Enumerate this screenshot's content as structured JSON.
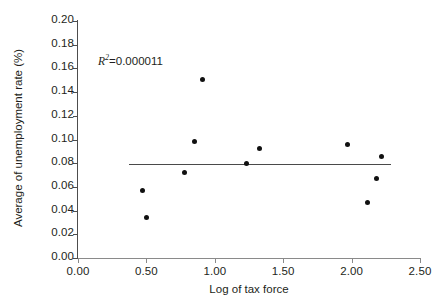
{
  "chart_data": {
    "type": "scatter",
    "title": "",
    "xlabel": "Log of tax force",
    "ylabel": "Average of unemployment rate (%)",
    "xlim": [
      0.0,
      2.5
    ],
    "ylim": [
      0.0,
      0.2
    ],
    "xticks": [
      "0.00",
      "0.50",
      "1.00",
      "1.50",
      "2.00",
      "2.50"
    ],
    "xtick_values": [
      0.0,
      0.5,
      1.0,
      1.5,
      2.0,
      2.5
    ],
    "yticks": [
      "0.00",
      "0.02",
      "0.04",
      "0.06",
      "0.08",
      "0.10",
      "0.12",
      "0.14",
      "0.16",
      "0.18",
      "0.20"
    ],
    "ytick_values": [
      0.0,
      0.02,
      0.04,
      0.06,
      0.08,
      0.1,
      0.12,
      0.14,
      0.16,
      0.18,
      0.2
    ],
    "grid": false,
    "legend": false,
    "annotations": [
      {
        "name": "r-squared",
        "prefix": "R",
        "superscript": "2",
        "text": "=0.000011",
        "value": 1.1e-05,
        "x": 0.37,
        "y": 0.168
      }
    ],
    "marker": {
      "shape": "circle",
      "color": "#111111",
      "size": 5
    },
    "points": [
      {
        "x": 0.47,
        "y": 0.057
      },
      {
        "x": 0.502,
        "y": 0.0338
      },
      {
        "x": 0.78,
        "y": 0.072
      },
      {
        "x": 0.855,
        "y": 0.0982
      },
      {
        "x": 0.91,
        "y": 0.151
      },
      {
        "x": 1.235,
        "y": 0.08
      },
      {
        "x": 1.325,
        "y": 0.0925
      },
      {
        "x": 1.97,
        "y": 0.0955
      },
      {
        "x": 2.115,
        "y": 0.0468
      },
      {
        "x": 2.18,
        "y": 0.0675
      },
      {
        "x": 2.222,
        "y": 0.0855
      }
    ],
    "trendline": {
      "name": "regression-line",
      "color": "#4a4a4a",
      "x_start": 0.375,
      "x_end": 2.285,
      "y_start": 0.0795,
      "y_end": 0.0793
    },
    "axis_color": "#4d4d4d"
  }
}
